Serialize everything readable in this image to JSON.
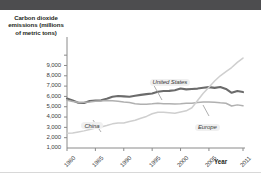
{
  "chart_data": {
    "type": "line",
    "title": "",
    "ylabel": "Carbon dioxide emissions (millions of metric tons)",
    "xlabel": "Year",
    "ylim": [
      0,
      9500
    ],
    "xlim": [
      1980,
      2011
    ],
    "grid": false,
    "legend_position": "inline-labels",
    "ytick_labels": [
      "9,000",
      "8,000",
      "7,000",
      "6,000",
      "5,000",
      "4,000",
      "3,000",
      "2,000",
      "1,000"
    ],
    "ytick_values": [
      9000,
      8000,
      7000,
      6000,
      5000,
      4000,
      3000,
      2000,
      1000
    ],
    "xtick_labels": [
      "1980",
      "1985",
      "1990",
      "1995",
      "2000",
      "2005",
      "2011"
    ],
    "xtick_values": [
      1980,
      1985,
      1990,
      1995,
      2000,
      2005,
      2011
    ],
    "x": [
      1980,
      1981,
      1982,
      1983,
      1984,
      1985,
      1986,
      1987,
      1988,
      1989,
      1990,
      1991,
      1992,
      1993,
      1994,
      1995,
      1996,
      1997,
      1998,
      1999,
      2000,
      2001,
      2002,
      2003,
      2004,
      2005,
      2006,
      2007,
      2008,
      2009,
      2010,
      2011
    ],
    "series": [
      {
        "name": "United States",
        "color": "#6b6b6b",
        "width": 2.1,
        "values": [
          4800,
          4600,
          4380,
          4360,
          4560,
          4600,
          4620,
          4780,
          4960,
          5040,
          5000,
          4970,
          5060,
          5150,
          5220,
          5280,
          5450,
          5520,
          5540,
          5600,
          5760,
          5680,
          5720,
          5760,
          5840,
          5900,
          5830,
          5920,
          5720,
          5350,
          5520,
          5420
        ]
      },
      {
        "name": "Europe",
        "color": "#b0b0b0",
        "width": 1.5,
        "values": [
          4620,
          4500,
          4440,
          4430,
          4470,
          4530,
          4560,
          4600,
          4580,
          4540,
          4450,
          4400,
          4300,
          4250,
          4240,
          4280,
          4340,
          4300,
          4300,
          4260,
          4290,
          4340,
          4340,
          4420,
          4450,
          4450,
          4440,
          4380,
          4340,
          4070,
          4180,
          4090
        ]
      },
      {
        "name": "China",
        "color": "#cfcfcf",
        "width": 1.5,
        "values": [
          1440,
          1450,
          1560,
          1660,
          1800,
          1930,
          2040,
          2180,
          2340,
          2430,
          2420,
          2570,
          2690,
          2880,
          3060,
          3320,
          3460,
          3470,
          3420,
          3360,
          3490,
          3600,
          3900,
          4600,
          5300,
          5900,
          6500,
          7000,
          7400,
          7800,
          8300,
          8720
        ]
      }
    ],
    "annotations": [
      {
        "label": "United States",
        "x": 1997,
        "y": 7300
      },
      {
        "label": "China",
        "x": 1985,
        "y": 3100
      },
      {
        "label": "Europe",
        "x": 2005,
        "y": 2950
      }
    ]
  },
  "axis_titles": {
    "y": "Carbon dioxide emissions (millions of metric tons)",
    "x": "Year"
  }
}
